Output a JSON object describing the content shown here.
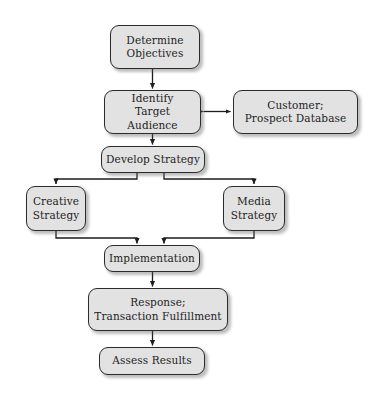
{
  "diagram": {
    "background_color": "#ffffff",
    "node_fill_color": "#e2e2e2",
    "node_border_color": "#2b2b2b",
    "edge_color": "#1d1d1d",
    "nodes": [
      {
        "id": "determine-objectives",
        "label": "Determine\nObjectives",
        "x": 110,
        "y": 25,
        "w": 90,
        "h": 44
      },
      {
        "id": "identify-target-audience",
        "label": "Identify\nTarget Audience",
        "x": 104,
        "y": 90,
        "w": 97,
        "h": 44
      },
      {
        "id": "customer-prospect-database",
        "label": "Customer;\nProspect Database",
        "x": 233,
        "y": 90,
        "w": 125,
        "h": 44
      },
      {
        "id": "develop-strategy",
        "label": "Develop Strategy",
        "x": 101,
        "y": 146,
        "w": 104,
        "h": 27
      },
      {
        "id": "creative-strategy",
        "label": "Creative\nStrategy",
        "x": 26,
        "y": 186,
        "w": 60,
        "h": 45
      },
      {
        "id": "media-strategy",
        "label": "Media\nStrategy",
        "x": 223,
        "y": 186,
        "w": 62,
        "h": 45
      },
      {
        "id": "implementation",
        "label": "Implementation",
        "x": 104,
        "y": 245,
        "w": 96,
        "h": 27
      },
      {
        "id": "response-transaction",
        "label": "Response;\nTransaction Fulfillment",
        "x": 88,
        "y": 288,
        "w": 140,
        "h": 43
      },
      {
        "id": "assess-results",
        "label": "Assess Results",
        "x": 99,
        "y": 347,
        "w": 106,
        "h": 28
      }
    ],
    "edges": [
      {
        "id": "edge-objectives-to-audience",
        "from": "determine-objectives",
        "to": "identify-target-audience",
        "type": "arrow-down"
      },
      {
        "id": "edge-audience-to-database",
        "from": "identify-target-audience",
        "to": "customer-prospect-database",
        "type": "double-arrow-horizontal"
      },
      {
        "id": "edge-audience-to-strategy",
        "from": "identify-target-audience",
        "to": "develop-strategy",
        "type": "arrow-down"
      },
      {
        "id": "edge-strategy-to-creative",
        "from": "develop-strategy",
        "to": "creative-strategy",
        "type": "elbow-left-down"
      },
      {
        "id": "edge-strategy-to-media",
        "from": "develop-strategy",
        "to": "media-strategy",
        "type": "elbow-right-down"
      },
      {
        "id": "edge-creative-to-implementation",
        "from": "creative-strategy",
        "to": "implementation",
        "type": "elbow-right-down"
      },
      {
        "id": "edge-media-to-implementation",
        "from": "media-strategy",
        "to": "implementation",
        "type": "elbow-left-down"
      },
      {
        "id": "edge-implementation-to-response",
        "from": "implementation",
        "to": "response-transaction",
        "type": "arrow-down"
      },
      {
        "id": "edge-response-to-assess",
        "from": "response-transaction",
        "to": "assess-results",
        "type": "arrow-down"
      }
    ]
  }
}
